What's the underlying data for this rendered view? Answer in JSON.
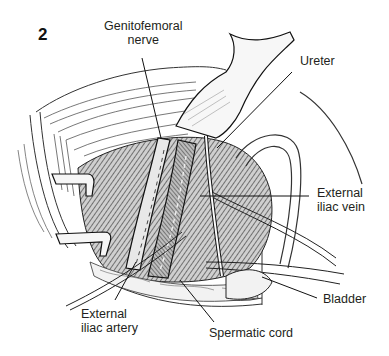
{
  "figure": {
    "number": "2",
    "type": "surgical anatomical line illustration",
    "colors": {
      "ink": "#231f20",
      "background": "#ffffff",
      "shading": "#4a4a4a"
    }
  },
  "labels": {
    "genitofemoral_nerve": {
      "line1": "Genitofemoral",
      "line2": "nerve"
    },
    "ureter": {
      "line1": "Ureter"
    },
    "external_iliac_vein": {
      "line1": "External",
      "line2": "iliac vein"
    },
    "bladder": {
      "line1": "Bladder"
    },
    "spermatic_cord": {
      "line1": "Spermatic cord"
    },
    "external_iliac_artery": {
      "line1": "External",
      "line2": "iliac artery"
    }
  }
}
